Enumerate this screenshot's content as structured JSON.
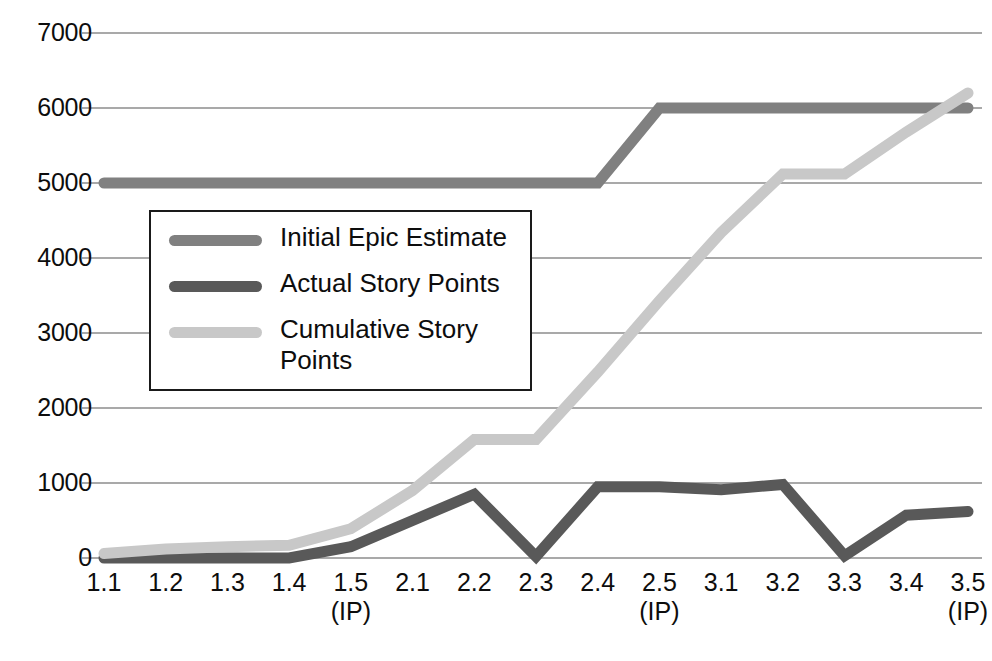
{
  "chart_data": {
    "type": "line",
    "title": "",
    "xlabel": "",
    "ylabel": "",
    "ylim": [
      0,
      7000
    ],
    "ytick_step": 1000,
    "grid": true,
    "legend_position": "inside-left",
    "categories": [
      "1.1",
      "1.2",
      "1.3",
      "1.4",
      "1.5",
      "2.1",
      "2.2",
      "2.3",
      "2.4",
      "2.5",
      "3.1",
      "3.2",
      "3.3",
      "3.4",
      "3.5"
    ],
    "category_sublabels": [
      "",
      "",
      "",
      "",
      "(IP)",
      "",
      "",
      "",
      "",
      "(IP)",
      "",
      "",
      "",
      "",
      "(IP)"
    ],
    "ytick_labels": [
      "7000",
      "6000",
      "5000",
      "4000",
      "3000",
      "2000",
      "1000",
      "0"
    ],
    "ytick_values": [
      7000,
      6000,
      5000,
      4000,
      3000,
      2000,
      1000,
      0
    ],
    "series": [
      {
        "name": "Initial Epic Estimate",
        "color": "#808080",
        "values": [
          5000,
          5000,
          5000,
          5000,
          5000,
          5000,
          5000,
          5000,
          5000,
          6000,
          6000,
          6000,
          6000,
          6000,
          6000
        ]
      },
      {
        "name": "Actual Story Points",
        "color": "#595959",
        "values": [
          0,
          0,
          0,
          0,
          150,
          500,
          850,
          20,
          950,
          950,
          910,
          980,
          30,
          570,
          620
        ]
      },
      {
        "name": "Cumulative Story Points",
        "color": "#c8c8c8",
        "values": [
          60,
          120,
          150,
          170,
          390,
          900,
          1580,
          1580,
          2480,
          3430,
          4340,
          5120,
          5120,
          5680,
          6200
        ]
      }
    ]
  },
  "legend": {
    "items": [
      {
        "label": "Initial Epic Estimate",
        "color": "#808080"
      },
      {
        "label": "Actual Story Points",
        "color": "#595959"
      },
      {
        "label": "Cumulative Story\nPoints",
        "color": "#c8c8c8"
      }
    ]
  },
  "axes": {
    "grid_color": "#8c8c8c",
    "axis_color": "#8c8c8c"
  }
}
